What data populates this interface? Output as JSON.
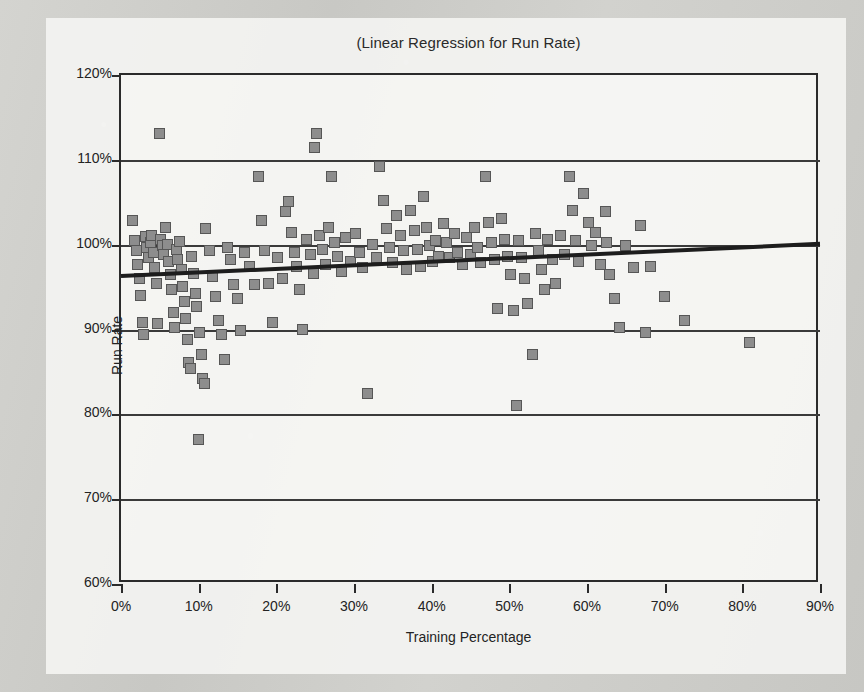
{
  "figure": {
    "title": "(Linear Regression for Run Rate)",
    "marker_fill": "#8d8d8d",
    "marker_stroke": "#565656",
    "line_color": "#1d1d1d",
    "axis_color": "#2b2b2b",
    "plate_color": "#f3f3f1",
    "page_color": "#cdcdc9"
  },
  "axes": {
    "x_title": "Training Percentage",
    "y_title": "Run Rate",
    "x_ticks": [
      "0%",
      "10%",
      "20%",
      "30%",
      "40%",
      "50%",
      "60%",
      "70%",
      "80%",
      "90%"
    ],
    "y_ticks": [
      "120%",
      "110%",
      "100%",
      "90%",
      "80%",
      "70%",
      "60%"
    ]
  },
  "chart_data": {
    "type": "scatter",
    "title": "(Linear Regression for Run Rate)",
    "xlabel": "Training Percentage",
    "ylabel": "Run Rate",
    "xlim": [
      0,
      90
    ],
    "ylim": [
      60,
      120
    ],
    "x_tick_values": [
      0,
      10,
      20,
      30,
      40,
      50,
      60,
      70,
      80,
      90
    ],
    "y_tick_values": [
      60,
      70,
      80,
      90,
      100,
      110,
      120
    ],
    "x_unit": "percent",
    "y_unit": "percent",
    "grid": "horizontal",
    "legend": "none",
    "series": [
      {
        "name": "Observations",
        "type": "scatter",
        "marker": "square",
        "points": [
          [
            1.5,
            102.8
          ],
          [
            1.8,
            100.4
          ],
          [
            2.0,
            99.2
          ],
          [
            2.2,
            97.6
          ],
          [
            2.4,
            96.0
          ],
          [
            2.6,
            94.0
          ],
          [
            2.8,
            90.8
          ],
          [
            3.0,
            89.4
          ],
          [
            3.2,
            100.9
          ],
          [
            3.4,
            99.6
          ],
          [
            3.6,
            98.4
          ],
          [
            3.8,
            100.2
          ],
          [
            4.0,
            101.0
          ],
          [
            4.2,
            99.0
          ],
          [
            4.4,
            97.2
          ],
          [
            4.6,
            95.4
          ],
          [
            4.8,
            90.6
          ],
          [
            5.0,
            113.0
          ],
          [
            5.2,
            100.6
          ],
          [
            5.4,
            99.8
          ],
          [
            5.6,
            98.8
          ],
          [
            5.8,
            102.0
          ],
          [
            6.0,
            100.0
          ],
          [
            6.2,
            98.0
          ],
          [
            6.4,
            96.4
          ],
          [
            6.6,
            94.6
          ],
          [
            6.8,
            92.0
          ],
          [
            7.0,
            90.2
          ],
          [
            7.2,
            99.4
          ],
          [
            7.4,
            98.2
          ],
          [
            7.6,
            100.3
          ],
          [
            7.8,
            97.0
          ],
          [
            8.0,
            95.0
          ],
          [
            8.2,
            93.2
          ],
          [
            8.4,
            91.2
          ],
          [
            8.6,
            88.8
          ],
          [
            8.8,
            86.0
          ],
          [
            9.0,
            85.4
          ],
          [
            9.2,
            98.6
          ],
          [
            9.4,
            96.6
          ],
          [
            9.6,
            94.2
          ],
          [
            9.8,
            92.6
          ],
          [
            10.0,
            77.0
          ],
          [
            10.2,
            89.6
          ],
          [
            10.4,
            87.0
          ],
          [
            10.6,
            84.2
          ],
          [
            10.8,
            83.6
          ],
          [
            11.0,
            101.8
          ],
          [
            11.4,
            99.2
          ],
          [
            11.8,
            96.2
          ],
          [
            12.2,
            93.8
          ],
          [
            12.6,
            91.0
          ],
          [
            13.0,
            89.4
          ],
          [
            13.4,
            86.4
          ],
          [
            13.8,
            99.6
          ],
          [
            14.2,
            98.2
          ],
          [
            14.6,
            95.2
          ],
          [
            15.0,
            93.6
          ],
          [
            15.4,
            89.8
          ],
          [
            16.0,
            99.0
          ],
          [
            16.6,
            97.4
          ],
          [
            17.2,
            95.2
          ],
          [
            17.8,
            108.0
          ],
          [
            18.2,
            102.8
          ],
          [
            18.6,
            99.2
          ],
          [
            19.0,
            95.4
          ],
          [
            19.6,
            90.8
          ],
          [
            20.2,
            98.4
          ],
          [
            20.8,
            96.0
          ],
          [
            21.2,
            103.8
          ],
          [
            21.6,
            105.0
          ],
          [
            22.0,
            101.4
          ],
          [
            22.4,
            99.0
          ],
          [
            22.6,
            97.4
          ],
          [
            23.0,
            94.6
          ],
          [
            23.4,
            90.0
          ],
          [
            24.0,
            100.6
          ],
          [
            24.4,
            98.8
          ],
          [
            24.8,
            96.6
          ],
          [
            25.0,
            111.4
          ],
          [
            25.2,
            113.0
          ],
          [
            25.6,
            101.0
          ],
          [
            26.0,
            99.4
          ],
          [
            26.4,
            97.6
          ],
          [
            26.8,
            102.0
          ],
          [
            27.2,
            108.0
          ],
          [
            27.6,
            100.2
          ],
          [
            28.0,
            98.6
          ],
          [
            28.4,
            96.8
          ],
          [
            29.0,
            100.8
          ],
          [
            29.6,
            98.0
          ],
          [
            30.2,
            101.2
          ],
          [
            30.8,
            99.0
          ],
          [
            31.2,
            97.2
          ],
          [
            31.8,
            82.4
          ],
          [
            32.4,
            100.0
          ],
          [
            33.0,
            98.4
          ],
          [
            33.4,
            109.2
          ],
          [
            33.8,
            105.2
          ],
          [
            34.2,
            101.8
          ],
          [
            34.6,
            99.6
          ],
          [
            35.0,
            97.8
          ],
          [
            35.6,
            103.4
          ],
          [
            36.0,
            101.0
          ],
          [
            36.4,
            99.2
          ],
          [
            36.8,
            97.0
          ],
          [
            37.4,
            104.0
          ],
          [
            37.8,
            101.6
          ],
          [
            38.2,
            99.4
          ],
          [
            38.6,
            97.4
          ],
          [
            39.0,
            105.6
          ],
          [
            39.4,
            102.0
          ],
          [
            39.8,
            99.8
          ],
          [
            40.2,
            98.0
          ],
          [
            40.6,
            100.4
          ],
          [
            41.0,
            98.6
          ],
          [
            41.6,
            102.4
          ],
          [
            42.0,
            100.2
          ],
          [
            42.4,
            98.4
          ],
          [
            43.0,
            101.2
          ],
          [
            43.4,
            99.0
          ],
          [
            44.0,
            97.6
          ],
          [
            44.6,
            100.8
          ],
          [
            45.0,
            98.8
          ],
          [
            45.6,
            102.0
          ],
          [
            46.0,
            99.6
          ],
          [
            46.4,
            97.8
          ],
          [
            47.0,
            108.0
          ],
          [
            47.4,
            102.6
          ],
          [
            47.8,
            100.2
          ],
          [
            48.2,
            98.2
          ],
          [
            48.6,
            92.4
          ],
          [
            49.0,
            103.0
          ],
          [
            49.4,
            100.6
          ],
          [
            49.8,
            98.6
          ],
          [
            50.2,
            96.4
          ],
          [
            50.6,
            92.2
          ],
          [
            51.0,
            81.0
          ],
          [
            51.2,
            100.4
          ],
          [
            51.6,
            98.4
          ],
          [
            52.0,
            96.0
          ],
          [
            52.4,
            93.0
          ],
          [
            53.0,
            87.0
          ],
          [
            53.4,
            101.2
          ],
          [
            53.8,
            99.2
          ],
          [
            54.2,
            97.0
          ],
          [
            54.6,
            94.6
          ],
          [
            55.0,
            100.6
          ],
          [
            55.6,
            98.2
          ],
          [
            56.0,
            95.4
          ],
          [
            56.6,
            101.0
          ],
          [
            57.2,
            98.8
          ],
          [
            57.8,
            108.0
          ],
          [
            58.2,
            104.0
          ],
          [
            58.6,
            100.4
          ],
          [
            59.0,
            98.0
          ],
          [
            59.6,
            106.0
          ],
          [
            60.2,
            102.6
          ],
          [
            60.6,
            99.8
          ],
          [
            61.2,
            101.4
          ],
          [
            61.8,
            97.6
          ],
          [
            62.4,
            103.8
          ],
          [
            62.6,
            100.2
          ],
          [
            63.0,
            96.4
          ],
          [
            63.6,
            93.6
          ],
          [
            64.2,
            90.2
          ],
          [
            65.0,
            99.8
          ],
          [
            66.0,
            97.2
          ],
          [
            67.0,
            102.2
          ],
          [
            67.6,
            89.6
          ],
          [
            68.2,
            97.4
          ],
          [
            70.0,
            93.8
          ],
          [
            72.6,
            91.0
          ],
          [
            81.0,
            88.4
          ]
        ]
      },
      {
        "name": "Linear Regression",
        "type": "line",
        "points": [
          [
            0,
            96.3
          ],
          [
            90,
            100.1
          ]
        ],
        "equation_slope": 0.042,
        "equation_intercept": 96.3
      }
    ]
  }
}
